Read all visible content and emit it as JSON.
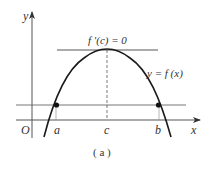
{
  "figure": {
    "caption": "( a )",
    "colors": {
      "ink": "#1a1a1a",
      "line": "#555555",
      "label": "#333333"
    }
  },
  "axes": {
    "x_label": "x",
    "y_label": "y",
    "origin_label": "O"
  },
  "labels": {
    "tangent": "f ′(c) = 0",
    "curve": "y = f (x)",
    "point_a": "a",
    "point_b": "b",
    "point_c": "c"
  },
  "diagram_elements": {
    "curve": "downward parabola through (a, f(a)) and (b, f(b)) with maximum at c",
    "horizontal_line": "y = f(a) = f(b)",
    "tangent_line": "horizontal tangent at peak x = c",
    "dashed_line": "vertical from peak down to c on x-axis",
    "points": [
      "(a, f(a))",
      "(b, f(b))"
    ]
  }
}
